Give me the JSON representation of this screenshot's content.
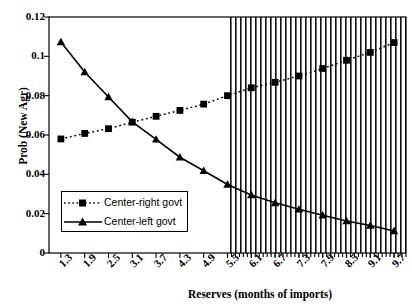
{
  "chart_data": {
    "type": "line",
    "title": "",
    "xlabel": "Reserves (months of imports)",
    "ylabel": "Prob (New Agr)",
    "xlim": [
      1.0,
      10.0
    ],
    "ylim": [
      0,
      0.12
    ],
    "grid": false,
    "legend_position": "inside-lower-left",
    "x_tick_labels": [
      "1.3",
      "1.9",
      "2.5",
      "3.1",
      "3.7",
      "4.3",
      "4.9",
      "5.5",
      "6.1",
      "6.7",
      "7.3",
      "7.9",
      "8.5",
      "9.1",
      "9.7"
    ],
    "y_tick_labels": [
      "0",
      "0.02",
      "0.04",
      "0.06",
      "0.08",
      "0.1",
      "0.12"
    ],
    "y_tick_values": [
      0,
      0.02,
      0.04,
      0.06,
      0.08,
      0.1,
      0.12
    ],
    "x": [
      1.3,
      1.9,
      2.5,
      3.1,
      3.7,
      4.3,
      4.9,
      5.5,
      6.1,
      6.7,
      7.3,
      7.9,
      8.5,
      9.1,
      9.7
    ],
    "series": [
      {
        "name": "Center-right govt",
        "marker": "square",
        "line_style": "dotted",
        "color": "#000000",
        "values": [
          0.058,
          0.0608,
          0.0632,
          0.0665,
          0.0695,
          0.0725,
          0.0757,
          0.08,
          0.084,
          0.0868,
          0.09,
          0.0938,
          0.098,
          0.102,
          0.107
        ]
      },
      {
        "name": "Center-left govt",
        "marker": "triangle",
        "line_style": "solid",
        "color": "#000000",
        "values": [
          0.1073,
          0.092,
          0.0793,
          0.0667,
          0.0578,
          0.0487,
          0.0418,
          0.0348,
          0.0295,
          0.0255,
          0.0222,
          0.0192,
          0.0163,
          0.014,
          0.0112
        ]
      }
    ],
    "shaded_region": {
      "style": "vertical-hatch",
      "x_start": 5.5,
      "x_end": 10.0,
      "label": ""
    }
  },
  "legend": {
    "items": [
      {
        "label": "Center-right govt",
        "marker": "square-marker",
        "line": "dotted-line"
      },
      {
        "label": "Center-left govt",
        "marker": "triangle-marker",
        "line": "solid-line"
      }
    ]
  }
}
